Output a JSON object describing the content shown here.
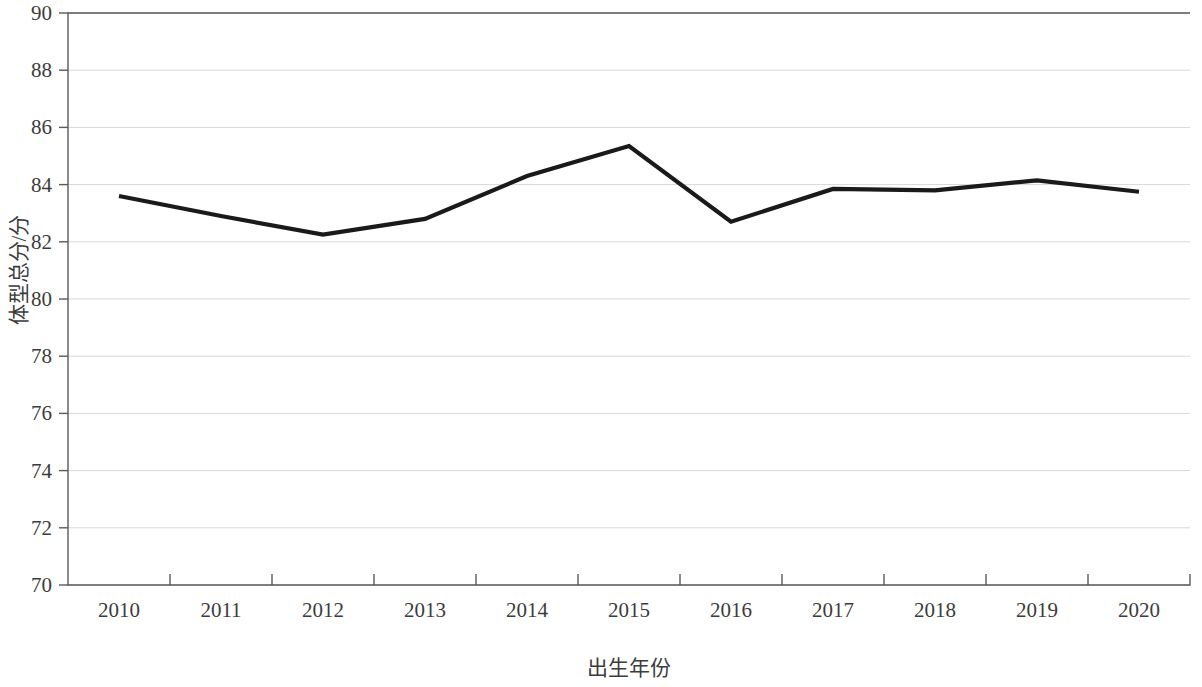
{
  "chart_data": {
    "type": "line",
    "title": "",
    "xlabel": "出生年份",
    "ylabel": "体型总分/分",
    "categories": [
      "2010",
      "2011",
      "2012",
      "2013",
      "2014",
      "2015",
      "2016",
      "2017",
      "2018",
      "2019",
      "2020"
    ],
    "x": [
      2010,
      2011,
      2012,
      2013,
      2014,
      2015,
      2016,
      2017,
      2018,
      2019,
      2020
    ],
    "values": [
      83.6,
      82.9,
      82.25,
      82.8,
      84.3,
      85.35,
      82.7,
      83.85,
      83.8,
      84.15,
      83.75
    ],
    "series": [
      {
        "name": "体型总分",
        "values": [
          83.6,
          82.9,
          82.25,
          82.8,
          84.3,
          85.35,
          82.7,
          83.85,
          83.8,
          84.15,
          83.75
        ],
        "color": "#1a1a1a"
      }
    ],
    "ylim": [
      70,
      90
    ],
    "ytick_labels": [
      "70",
      "72",
      "74",
      "76",
      "78",
      "80",
      "82",
      "84",
      "86",
      "88",
      "90"
    ],
    "yticks": [
      70,
      72,
      74,
      76,
      78,
      80,
      82,
      84,
      86,
      88,
      90
    ],
    "xtick_labels": [
      "2010",
      "2011",
      "2012",
      "2013",
      "2014",
      "2015",
      "2016",
      "2017",
      "2018",
      "2019",
      "2020"
    ],
    "grid": true,
    "grid_axis": "y",
    "grid_color": "#d8d8d8",
    "legend": false,
    "legend_position": "none",
    "line_color": "#1a1a1a",
    "line_width": 4,
    "markers": false,
    "background_color": "#ffffff",
    "axis_color": "#5a5a5a"
  },
  "axes": {
    "y_title": "体型总分/分",
    "x_title": "出生年份"
  }
}
